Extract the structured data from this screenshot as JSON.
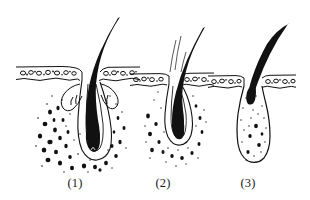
{
  "figure": {
    "kind": "anatomical-line-drawing",
    "background_color": "#ffffff",
    "ink_color": "#111111",
    "panel_count": 3,
    "panels": [
      {
        "caption": "(1)",
        "phase_depicted": "long hair shaft, deep active follicle with bulb and sebaceous glands, dense stippled surrounding cells",
        "hair_shaft": "long, curved, tapering to fine tip at upper right",
        "follicle_depth": "deep",
        "surrounding_stipple_density": "dense",
        "sebaceous_glands": 2
      },
      {
        "caption": "(2)",
        "phase_depicted": "shortened club-shaped follicle, hair root retracting upward, moderate stippling",
        "hair_shaft": "curved, tapering, slightly shorter than panel one",
        "follicle_depth": "medium",
        "surrounding_stipple_density": "moderate",
        "sebaceous_glands": 0
      },
      {
        "caption": "(3)",
        "phase_depicted": "short club hair resting in a shrunken stippled sac",
        "hair_shaft": "short, curved, thick blunt club root",
        "follicle_depth": "shallow",
        "surrounding_stipple_density": "light",
        "sebaceous_glands": 0
      }
    ],
    "skin_surface": {
      "rendering": "two wavy parallel lines forming the epidermis band with small round cells between them"
    }
  }
}
